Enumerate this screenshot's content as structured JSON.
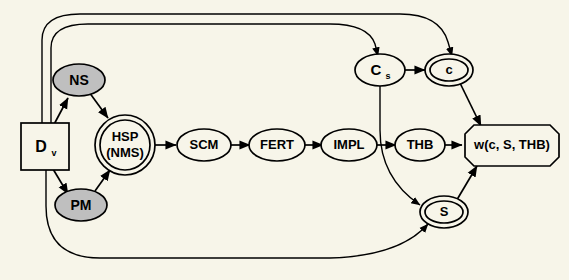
{
  "diagram": {
    "background_color": "#f7f5e9",
    "line_color": "#000000",
    "shaded_fill": "#bfbfbf",
    "nodes": [
      {
        "id": "dv",
        "label": "D",
        "sublabel": "v",
        "shape": "rectangle",
        "shaded": false
      },
      {
        "id": "ns",
        "label": "NS",
        "sublabel": "",
        "shape": "ellipse",
        "shaded": true
      },
      {
        "id": "pm",
        "label": "PM",
        "sublabel": "",
        "shape": "ellipse",
        "shaded": true
      },
      {
        "id": "hsp",
        "label": "HSP",
        "sublabel": "(NMS)",
        "shape": "double-circle",
        "shaded": false
      },
      {
        "id": "scm",
        "label": "SCM",
        "sublabel": "",
        "shape": "ellipse",
        "shaded": false
      },
      {
        "id": "fert",
        "label": "FERT",
        "sublabel": "",
        "shape": "ellipse",
        "shaded": false
      },
      {
        "id": "impl",
        "label": "IMPL",
        "sublabel": "",
        "shape": "ellipse",
        "shaded": false
      },
      {
        "id": "thb",
        "label": "THB",
        "sublabel": "",
        "shape": "ellipse",
        "shaded": false
      },
      {
        "id": "cs",
        "label": "C",
        "sublabel": "s",
        "shape": "ellipse",
        "shaded": false
      },
      {
        "id": "c",
        "label": "c",
        "sublabel": "",
        "shape": "double-ellipse",
        "shaded": false
      },
      {
        "id": "s",
        "label": "S",
        "sublabel": "",
        "shape": "double-ellipse",
        "shaded": false
      },
      {
        "id": "w",
        "label": "w(c, S, THB)",
        "sublabel": "",
        "shape": "octagon",
        "shaded": false
      }
    ],
    "edges": [
      {
        "from": "dv",
        "to": "ns",
        "style": "straight"
      },
      {
        "from": "ns",
        "to": "hsp",
        "style": "straight"
      },
      {
        "from": "dv",
        "to": "pm",
        "style": "straight"
      },
      {
        "from": "pm",
        "to": "hsp",
        "style": "straight"
      },
      {
        "from": "hsp",
        "to": "scm",
        "style": "straight"
      },
      {
        "from": "scm",
        "to": "fert",
        "style": "straight"
      },
      {
        "from": "fert",
        "to": "impl",
        "style": "straight"
      },
      {
        "from": "impl",
        "to": "thb",
        "style": "straight"
      },
      {
        "from": "thb",
        "to": "w",
        "style": "straight"
      },
      {
        "from": "cs",
        "to": "c",
        "style": "straight"
      },
      {
        "from": "c",
        "to": "w",
        "style": "straight"
      },
      {
        "from": "s",
        "to": "w",
        "style": "straight"
      },
      {
        "from": "cs",
        "to": "s",
        "style": "curved"
      },
      {
        "from": "dv",
        "to": "cs",
        "style": "arc-top-inner"
      },
      {
        "from": "dv",
        "to": "c",
        "style": "arc-top-outer"
      },
      {
        "from": "dv",
        "to": "s",
        "style": "arc-bottom"
      }
    ]
  }
}
